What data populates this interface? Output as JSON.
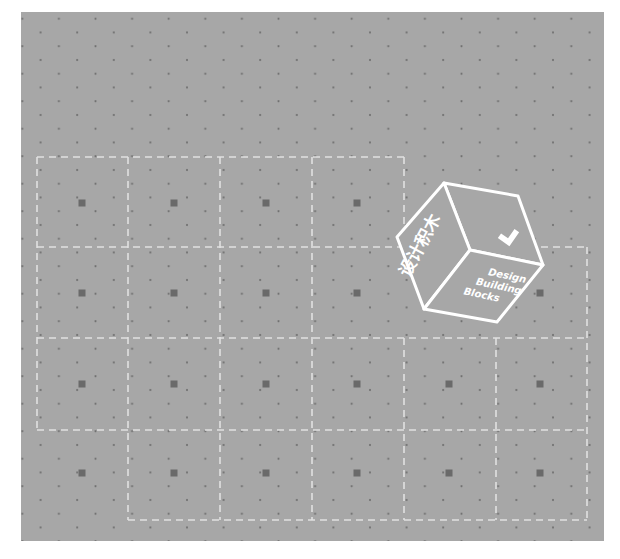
{
  "artwork": {
    "title": "Design Building Blocks",
    "cube_label_lines": [
      "Design",
      "Building",
      "Blocks"
    ],
    "cube_side_text": "设计积木",
    "colors": {
      "page_background": "#ffffff",
      "panel": "#a7a7a7",
      "dot": "#6e6e6e",
      "module_square": "#6a6a6a",
      "dashed_line": "#e8e8e8",
      "cube_stroke": "#ffffff"
    }
  },
  "grid": {
    "rows": [
      {
        "label": "row-1",
        "cells": 4,
        "squares": 4
      },
      {
        "label": "row-2",
        "cells": 6,
        "squares": 5
      },
      {
        "label": "row-3",
        "cells": 6,
        "squares": 6
      },
      {
        "label": "row-4",
        "cells": 5,
        "squares": 6
      }
    ]
  }
}
